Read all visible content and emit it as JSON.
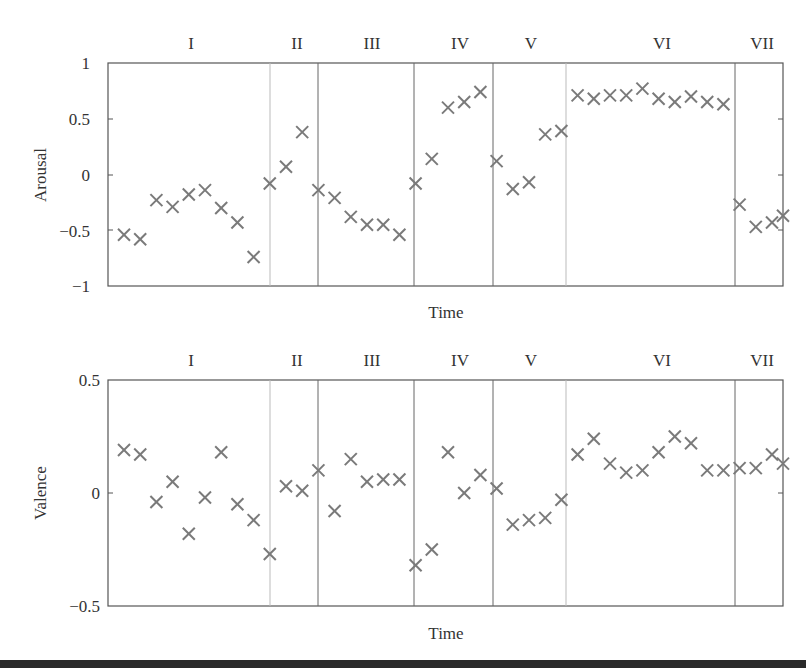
{
  "chart_data": [
    {
      "type": "scatter",
      "title": "",
      "xlabel": "Time",
      "ylabel": "Arousal",
      "ylim": [
        -1,
        1
      ],
      "yticks": [
        "1",
        "0.5",
        "0",
        "-0.5",
        "-1"
      ],
      "grid": false,
      "marker": "x",
      "marker_color": "#7a7a7a",
      "regions": [
        "I",
        "II",
        "III",
        "IV",
        "V",
        "VI",
        "VII"
      ],
      "region_boundaries_index": [
        9,
        12,
        18,
        23,
        27,
        38
      ],
      "values": [
        -0.54,
        -0.58,
        -0.23,
        -0.29,
        -0.18,
        -0.14,
        -0.3,
        -0.43,
        -0.74,
        -0.08,
        0.07,
        0.38,
        -0.14,
        -0.21,
        -0.38,
        -0.45,
        -0.45,
        -0.54,
        -0.08,
        0.14,
        0.6,
        0.65,
        0.74,
        0.12,
        -0.13,
        -0.07,
        0.36,
        0.39,
        0.71,
        0.68,
        0.71,
        0.71,
        0.77,
        0.68,
        0.65,
        0.7,
        0.65,
        0.63,
        -0.27,
        -0.47,
        -0.43,
        -0.37
      ]
    },
    {
      "type": "scatter",
      "title": "",
      "xlabel": "Time",
      "ylabel": "Valence",
      "ylim": [
        -0.5,
        0.5
      ],
      "yticks": [
        "0.5",
        "0",
        "-0.5"
      ],
      "grid": false,
      "marker": "x",
      "marker_color": "#7a7a7a",
      "regions": [
        "I",
        "II",
        "III",
        "IV",
        "V",
        "VI",
        "VII"
      ],
      "region_boundaries_index": [
        9,
        12,
        18,
        23,
        27,
        38
      ],
      "values": [
        0.19,
        0.17,
        -0.04,
        0.05,
        -0.18,
        -0.02,
        0.18,
        -0.05,
        -0.12,
        -0.27,
        0.03,
        0.01,
        0.1,
        -0.08,
        0.15,
        0.05,
        0.06,
        0.06,
        -0.32,
        -0.25,
        0.18,
        0.0,
        0.08,
        0.02,
        -0.14,
        -0.12,
        -0.11,
        -0.03,
        0.17,
        0.24,
        0.13,
        0.09,
        0.1,
        0.18,
        0.25,
        0.22,
        0.1,
        0.1,
        0.11,
        0.11,
        0.17,
        0.13
      ]
    }
  ],
  "labels": {
    "top_ylabel": "Arousal",
    "bottom_ylabel": "Valence",
    "top_xlabel": "Time",
    "bottom_xlabel": "Time",
    "top_ticks": [
      "1",
      "0.5",
      "0",
      "−0.5",
      "−1"
    ],
    "bottom_ticks": [
      "0.5",
      "0",
      "−0.5"
    ],
    "regions": [
      "I",
      "II",
      "III",
      "IV",
      "V",
      "VI",
      "VII"
    ]
  }
}
